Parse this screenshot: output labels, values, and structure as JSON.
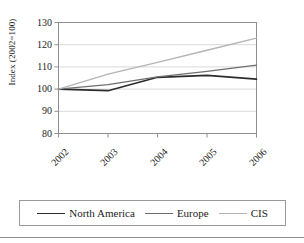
{
  "chart_data": {
    "type": "line",
    "title": "",
    "xlabel": "",
    "ylabel": "Index (2002=100)",
    "categories": [
      "2002",
      "2003",
      "2004",
      "2005",
      "2006"
    ],
    "x_tick_rotation": -45,
    "ylim": [
      80,
      130
    ],
    "y_ticks": [
      80,
      90,
      100,
      110,
      120,
      130
    ],
    "grid": "horizontal",
    "legend_position": "bottom",
    "series": [
      {
        "name": "North America",
        "color": "#2b2b2b",
        "width": 1.6,
        "values": [
          100.0,
          99.3,
          105.3,
          106.2,
          104.5
        ]
      },
      {
        "name": "Europe",
        "color": "#6e6e6e",
        "width": 1.3,
        "values": [
          100.0,
          102.0,
          105.5,
          108.0,
          110.8
        ]
      },
      {
        "name": "CIS",
        "color": "#b4b4b4",
        "width": 1.3,
        "values": [
          100.0,
          106.7,
          112.0,
          117.5,
          123.0
        ]
      }
    ],
    "colors": {
      "axis": "#8f8f8f",
      "grid": "#d9d9d9",
      "text": "#1c1c1c",
      "plot_background": "#ffffff",
      "legend_border": "#9a9a9a",
      "rule": "#8d8d8d"
    }
  }
}
